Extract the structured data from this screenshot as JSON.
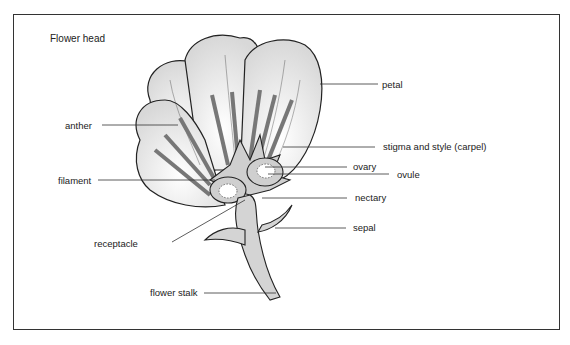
{
  "diagram": {
    "title": "Flower head",
    "labels": {
      "petal": "petal",
      "anther": "anther",
      "stigma": "stigma and style (carpel)",
      "ovary": "ovary",
      "ovule": "ovule",
      "filament": "filament",
      "nectary": "nectary",
      "sepal": "sepal",
      "receptacle": "receptacle",
      "stalk": "flower stalk"
    },
    "colors": {
      "line": "#222222",
      "petal_fill": "#f4f4f4",
      "carpel_fill": "#cfcfcf",
      "stamen_fill": "#8a8a8a"
    }
  }
}
